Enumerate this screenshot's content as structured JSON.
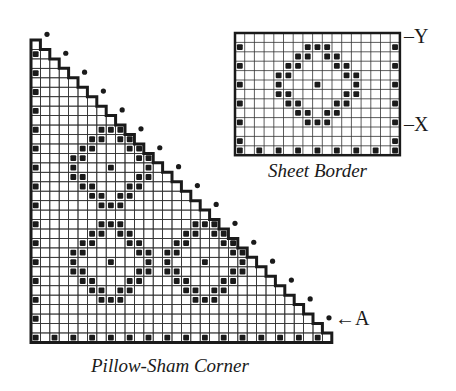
{
  "figure": {
    "sheet_border": {
      "caption": "Sheet Border",
      "grid": {
        "cols": 17,
        "rows": 13
      },
      "side_marks_rows": [
        1,
        3,
        5,
        7,
        9,
        11
      ],
      "bottom_row": 12,
      "bottom_marks_cols": [
        0,
        2,
        4,
        6,
        8,
        10,
        12,
        14,
        16
      ],
      "motif": {
        "type": "diamond",
        "center_col": 8,
        "center_row": 5
      },
      "labels": [
        {
          "text": "Y",
          "position": "top-right"
        },
        {
          "text": "X",
          "position": "right"
        }
      ]
    },
    "pillow_sham_corner": {
      "caption": "Pillow-Sham Corner",
      "grid": {
        "size": 32,
        "shape": "staircase-triangle"
      },
      "left_marks_rows": [
        1,
        3,
        5,
        7,
        9,
        11,
        13,
        15,
        17,
        19,
        21,
        23,
        25,
        27,
        29
      ],
      "bottom_row": 31,
      "bottom_marks_cols": [
        0,
        2,
        4,
        6,
        8,
        10,
        12,
        14,
        16,
        18,
        20,
        22,
        24,
        26,
        28,
        30
      ],
      "motifs": [
        {
          "type": "diamond",
          "center_col": 8,
          "center_row": 13
        },
        {
          "type": "diamond",
          "center_col": 8,
          "center_row": 23
        },
        {
          "type": "diamond",
          "center_col": 18,
          "center_row": 23
        }
      ],
      "edge_dots_count": 16,
      "annotation": {
        "text": "A",
        "arrow": "←"
      }
    },
    "diamond_offsets": [
      [
        -4,
        -1
      ],
      [
        -4,
        0
      ],
      [
        -4,
        1
      ],
      [
        -4,
        -1
      ],
      [
        -4,
        -1
      ]
    ]
  }
}
